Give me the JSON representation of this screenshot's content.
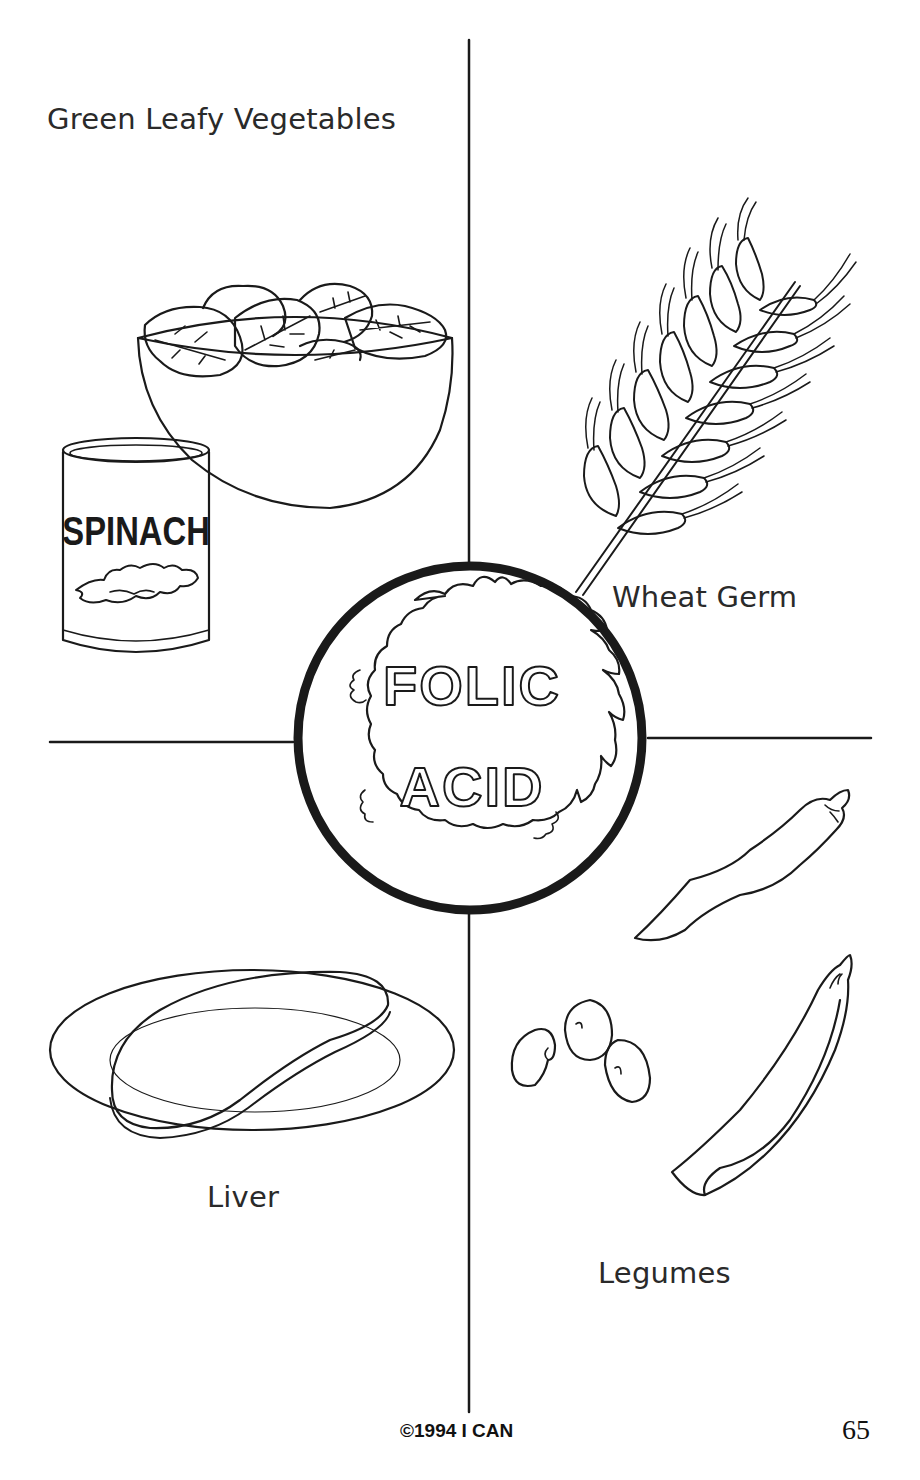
{
  "page": {
    "title_center_line1": "FOLIC",
    "title_center_line2": "ACID",
    "page_number": "65",
    "copyright": "©1994 I CAN"
  },
  "quadrants": [
    {
      "id": "top-left",
      "label": "Green Leafy Vegetables",
      "items": [
        "salad bowl of spinach leaves",
        "spinach can"
      ]
    },
    {
      "id": "top-right",
      "label": "Wheat Germ",
      "items": [
        "wheat stalk"
      ]
    },
    {
      "id": "bottom-left",
      "label": "Liver",
      "items": [
        "liver on plate"
      ]
    },
    {
      "id": "bottom-right",
      "label": "Legumes",
      "items": [
        "bean pod",
        "kidney beans",
        "pea pod"
      ]
    }
  ],
  "can": {
    "label": "SPINACH"
  },
  "colors": {
    "ink": "#1a1a1a",
    "paper": "#ffffff"
  }
}
